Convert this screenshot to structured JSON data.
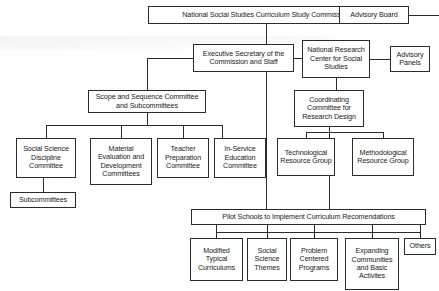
{
  "diagram": {
    "colors": {
      "line": "#2b2b2b",
      "box_fill": "#ffffff",
      "background": "#fefefe",
      "text": "#1a1a1a"
    },
    "nodes": {
      "commission": {
        "label": "National Social Studies Curriculum Study Commission",
        "x": 148,
        "y": 6,
        "w": 236,
        "h": 18,
        "fs": 7.2
      },
      "advisory_board": {
        "label": "Advisory Board",
        "x": 339,
        "y": 6,
        "w": 70,
        "h": 18,
        "fs": 7.2
      },
      "executive_secretary": {
        "label": "Executive Secretary of the Commission and Staff",
        "x": 193,
        "y": 44,
        "w": 101,
        "h": 28,
        "fs": 7.2
      },
      "research_center": {
        "label": "National Research Center for Social Studies",
        "x": 302,
        "y": 40,
        "w": 68,
        "h": 38,
        "fs": 7.2
      },
      "advisory_panels": {
        "label": "Advisory Panels",
        "x": 390,
        "y": 46,
        "w": 40,
        "h": 26,
        "fs": 7.2
      },
      "scope_sequence": {
        "label": "Scope and Sequence Committee and Subcommittees",
        "x": 88,
        "y": 90,
        "w": 118,
        "h": 23,
        "fs": 7.2
      },
      "coordinating_committee": {
        "label": "Coordinating Committee for Research Design",
        "x": 294,
        "y": 90,
        "w": 70,
        "h": 37,
        "fs": 7.2
      },
      "social_science_discipline": {
        "label": "Social Science Discipline Committee",
        "x": 16,
        "y": 138,
        "w": 60,
        "h": 40,
        "fs": 7.2
      },
      "material_evaluation": {
        "label": "Material Evaluation and Development Committees",
        "x": 90,
        "y": 138,
        "w": 62,
        "h": 47,
        "fs": 7.2
      },
      "teacher_preparation": {
        "label": "Teacher Preparation Committee",
        "x": 157,
        "y": 138,
        "w": 52,
        "h": 40,
        "fs": 7.2
      },
      "in_service_education": {
        "label": "In-Service Education Committee",
        "x": 214,
        "y": 138,
        "w": 52,
        "h": 40,
        "fs": 7.2
      },
      "technological_resource": {
        "label": "Technological Resource Group",
        "x": 277,
        "y": 138,
        "w": 58,
        "h": 38,
        "fs": 7.2
      },
      "methodological_resource": {
        "label": "Methodological Resource Group",
        "x": 352,
        "y": 138,
        "w": 62,
        "h": 38,
        "fs": 7.2
      },
      "subcommittees": {
        "label": "Subcommittees",
        "x": 10,
        "y": 192,
        "w": 66,
        "h": 16,
        "fs": 7.2
      },
      "pilot_schools": {
        "label": "Pilot Schools to Implement Curriculum Recomendations",
        "x": 191,
        "y": 209,
        "w": 235,
        "h": 16,
        "fs": 7.2
      },
      "modified_typical": {
        "label": "Modified Typical Curriculums",
        "x": 190,
        "y": 238,
        "w": 53,
        "h": 43,
        "fs": 7.2
      },
      "social_science_themes": {
        "label": "Social Science Themes",
        "x": 247,
        "y": 238,
        "w": 40,
        "h": 43,
        "fs": 7.2
      },
      "problem_centered": {
        "label": "Problem Centered Programs",
        "x": 290,
        "y": 238,
        "w": 48,
        "h": 43,
        "fs": 7.2
      },
      "expanding_communities": {
        "label": "Expanding Communities and Basic Activites",
        "x": 345,
        "y": 238,
        "w": 54,
        "h": 52,
        "fs": 7.2
      },
      "others": {
        "label": "Others",
        "x": 404,
        "y": 238,
        "w": 32,
        "h": 17,
        "fs": 7.2
      }
    },
    "connectors": [
      {
        "name": "commission-to-advisory-board",
        "type": "h",
        "x": 384,
        "y": 15,
        "len": 55
      },
      {
        "name": "commission-down-stem",
        "type": "v",
        "x": 266,
        "y": 24,
        "len": 20
      },
      {
        "name": "exec-sec-to-research-center",
        "type": "h",
        "x": 294,
        "y": 58,
        "len": 8
      },
      {
        "name": "research-center-to-advisory-panels",
        "type": "h",
        "x": 370,
        "y": 59,
        "len": 20
      },
      {
        "name": "exec-sec-left-stub",
        "type": "h",
        "x": 147,
        "y": 58,
        "len": 46
      },
      {
        "name": "exec-sec-left-down",
        "type": "v",
        "x": 147,
        "y": 58,
        "len": 32
      },
      {
        "name": "exec-sec-left-to-scope",
        "type": "h",
        "x": 147,
        "y": 90,
        "len": 0
      },
      {
        "name": "scope-top-stem",
        "type": "v",
        "x": 147,
        "y": 80,
        "len": 10
      },
      {
        "name": "exec-sec-down-long",
        "type": "v",
        "x": 266,
        "y": 72,
        "len": 137
      },
      {
        "name": "research-center-down",
        "type": "v",
        "x": 336,
        "y": 78,
        "len": 12
      },
      {
        "name": "scope-bottom-bus-left",
        "type": "h",
        "x": 46,
        "y": 125,
        "len": 176
      },
      {
        "name": "scope-bottom-stem",
        "type": "v",
        "x": 147,
        "y": 113,
        "len": 12
      },
      {
        "name": "drop-social-science",
        "type": "v",
        "x": 46,
        "y": 125,
        "len": 13
      },
      {
        "name": "drop-material-eval",
        "type": "v",
        "x": 121,
        "y": 125,
        "len": 13
      },
      {
        "name": "drop-teacher-prep",
        "type": "v",
        "x": 183,
        "y": 125,
        "len": 13
      },
      {
        "name": "drop-in-service",
        "type": "v",
        "x": 222,
        "y": 125,
        "len": 13
      },
      {
        "name": "coord-bottom-bus",
        "type": "h",
        "x": 306,
        "y": 132,
        "len": 77
      },
      {
        "name": "coord-bottom-stem",
        "type": "v",
        "x": 329,
        "y": 127,
        "len": 5
      },
      {
        "name": "drop-technological",
        "type": "v",
        "x": 306,
        "y": 132,
        "len": 6
      },
      {
        "name": "drop-methodological",
        "type": "v",
        "x": 383,
        "y": 132,
        "len": 6
      },
      {
        "name": "coord-center-down-long",
        "type": "v",
        "x": 329,
        "y": 132,
        "len": 77
      },
      {
        "name": "social-science-to-subcommittees",
        "type": "v",
        "x": 43,
        "y": 178,
        "len": 14
      },
      {
        "name": "pilot-bottom-bus",
        "type": "h",
        "x": 216,
        "y": 232,
        "len": 204
      },
      {
        "name": "drop-modified",
        "type": "v",
        "x": 216,
        "y": 225,
        "len": 13
      },
      {
        "name": "drop-themes",
        "type": "v",
        "x": 267,
        "y": 225,
        "len": 13
      },
      {
        "name": "drop-problem",
        "type": "v",
        "x": 314,
        "y": 225,
        "len": 13
      },
      {
        "name": "drop-expanding",
        "type": "v",
        "x": 372,
        "y": 225,
        "len": 13
      },
      {
        "name": "drop-others",
        "type": "v",
        "x": 420,
        "y": 225,
        "len": 13
      }
    ]
  }
}
